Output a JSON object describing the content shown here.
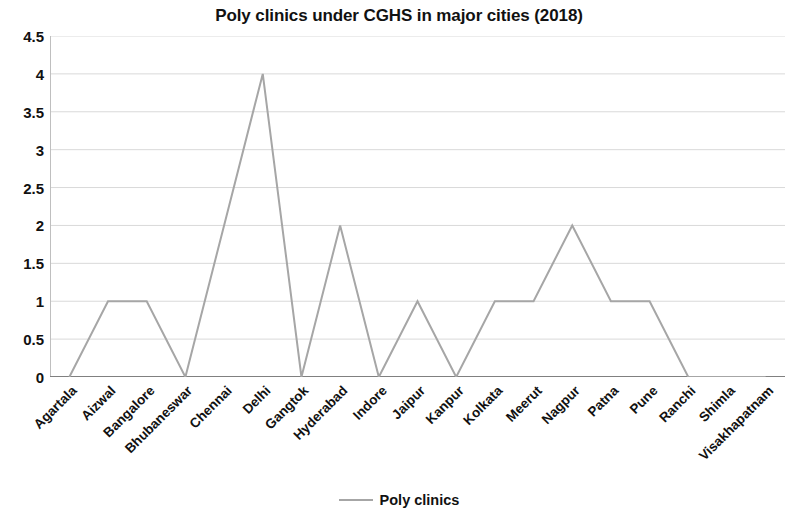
{
  "chart_data": {
    "type": "line",
    "title": "Poly clinics under CGHS in major cities (2018)",
    "xlabel": "",
    "ylabel": "",
    "categories": [
      "Agartala",
      "Aizwal",
      "Bangalore",
      "Bhubaneswar",
      "Chennai",
      "Delhi",
      "Gangtok",
      "Hyderabad",
      "Indore",
      "Jaipur",
      "Kanpur",
      "Kolkata",
      "Meerut",
      "Nagpur",
      "Patna",
      "Pune",
      "Ranchi",
      "Shimla",
      "Visakhapatnam"
    ],
    "series": [
      {
        "name": "Poly clinics",
        "values": [
          0,
          1,
          1,
          0,
          2,
          4,
          0,
          2,
          0,
          1,
          0,
          1,
          1,
          2,
          1,
          1,
          0,
          0,
          0
        ],
        "color": "#a6a6a6"
      }
    ],
    "ylim": [
      0,
      4.5
    ],
    "y_ticks": [
      "0",
      "0.5",
      "1",
      "1.5",
      "2",
      "2.5",
      "3",
      "3.5",
      "4",
      "4.5"
    ],
    "y_tick_values": [
      0,
      0.5,
      1,
      1.5,
      2,
      2.5,
      3,
      3.5,
      4,
      4.5
    ],
    "grid": true,
    "grid_color": "#d9d9d9",
    "legend_position": "bottom",
    "legend": [
      "Poly clinics"
    ]
  },
  "legend": {
    "label": "Poly clinics"
  }
}
